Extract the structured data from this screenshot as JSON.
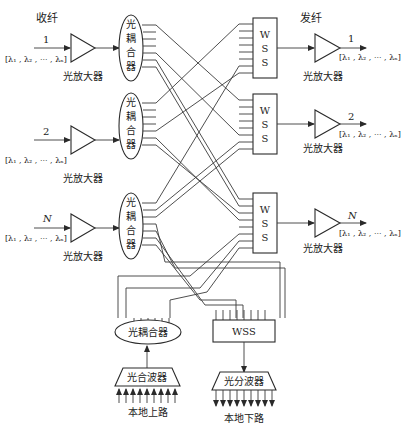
{
  "labels": {
    "rx_fiber": "收纤",
    "tx_fiber": "发纤",
    "amplifier": "光放大器",
    "coupler_vertical": [
      "光",
      "耦",
      "合",
      "器"
    ],
    "wss_vertical": [
      "W",
      "S",
      "S"
    ],
    "coupler_horizontal": "光耦合器",
    "wss_horizontal": "WSS",
    "multiplexer": "光合波器",
    "demultiplexer": "光分波器",
    "local_add": "本地上路",
    "local_drop": "本地下路",
    "wavelength_set": "[λ₁ , λ₂ , ··· , λₙ]"
  },
  "inputs": [
    {
      "index": "1",
      "amp_label": "光放大器",
      "wavelengths": "[λ₁ , λ₂ , ··· , λₙ]"
    },
    {
      "index": "2",
      "amp_label": "光放大器",
      "wavelengths": "[λ₁ , λ₂ , ··· , λₙ]"
    },
    {
      "index": "N",
      "amp_label": "光放大器",
      "wavelengths": "[λ₁ , λ₂ , ··· , λₙ]"
    }
  ],
  "outputs": [
    {
      "index": "1",
      "amp_label": "光放大器",
      "wavelengths": "[λ₁ , λ₂ , ··· , λₙ]"
    },
    {
      "index": "2",
      "amp_label": "光放大器",
      "wavelengths": "[λ₁ , λ₂ , ··· , λₙ]"
    },
    {
      "index": "N",
      "amp_label": "光放大器",
      "wavelengths": "[λ₁ , λ₂ , ··· , λₙ]"
    }
  ]
}
